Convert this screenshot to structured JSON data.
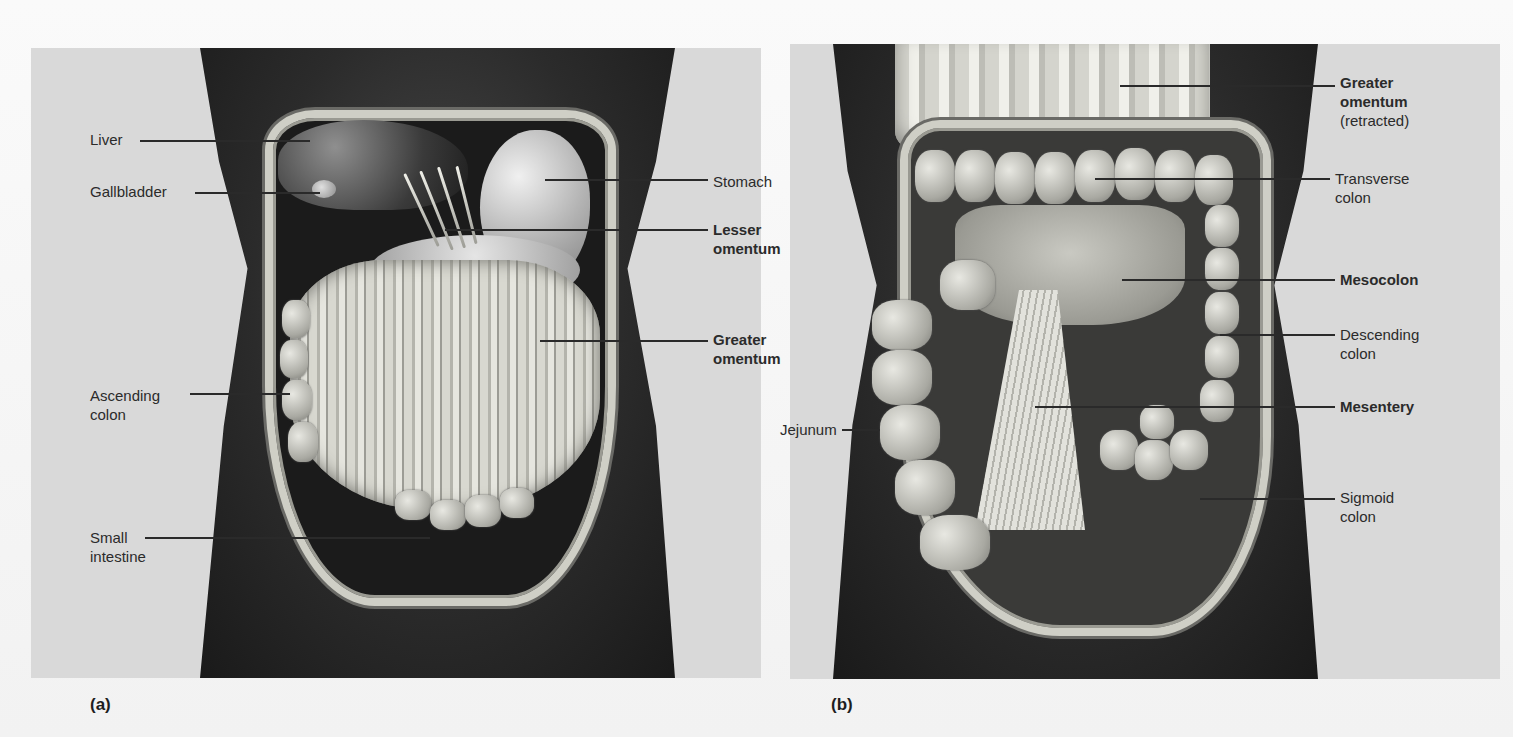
{
  "figure": {
    "panels": [
      {
        "tag": "(a)",
        "labels": [
          {
            "text": "Liver",
            "bold": false
          },
          {
            "text": "Gallbladder",
            "bold": false
          },
          {
            "text": "Stomach",
            "bold": false
          },
          {
            "text": "Lesser omentum",
            "line1": "Lesser",
            "line2": "omentum",
            "bold": true
          },
          {
            "text": "Greater omentum",
            "line1": "Greater",
            "line2": "omentum",
            "bold": true
          },
          {
            "text": "Ascending colon",
            "line1": "Ascending",
            "line2": "colon",
            "bold": false
          },
          {
            "text": "Small intestine",
            "line1": "Small",
            "line2": "intestine",
            "bold": false
          }
        ]
      },
      {
        "tag": "(b)",
        "labels": [
          {
            "text": "Greater omentum (retracted)",
            "line1": "Greater",
            "line2": "omentum",
            "line3": "(retracted)",
            "bold": true
          },
          {
            "text": "Transverse colon",
            "line1": "Transverse",
            "line2": "colon",
            "bold": false
          },
          {
            "text": "Mesocolon",
            "bold": true
          },
          {
            "text": "Descending colon",
            "line1": "Descending",
            "line2": "colon",
            "bold": false
          },
          {
            "text": "Mesentery",
            "bold": true
          },
          {
            "text": "Jejunum",
            "bold": false
          },
          {
            "text": "Sigmoid colon",
            "line1": "Sigmoid",
            "line2": "colon",
            "bold": false
          }
        ]
      }
    ]
  },
  "colors": {
    "background": "#d9d9d9",
    "torso": "#2b2b2b",
    "label_text": "#2b2b2b",
    "leader_line": "#2a2a2a"
  }
}
